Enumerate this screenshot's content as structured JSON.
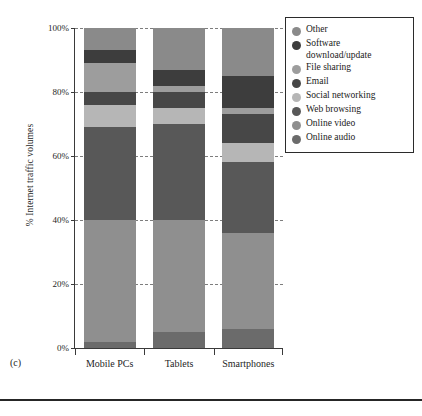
{
  "panel": {
    "label": "(c)"
  },
  "axes": {
    "ylabel": "% Internet traffic volumes",
    "yticks": [
      "0%",
      "20%",
      "40%",
      "60%",
      "80%",
      "100%"
    ],
    "ytick_values": [
      0,
      20,
      40,
      60,
      80,
      100
    ],
    "ylim": [
      0,
      100
    ],
    "xlabel": ""
  },
  "legend": {
    "position": "top-right",
    "entries": [
      {
        "label": "Other",
        "color": "#8a8a8a"
      },
      {
        "label": "Software\ndownload/update",
        "color": "#3d3d3d"
      },
      {
        "label": "File sharing",
        "color": "#9d9d9d"
      },
      {
        "label": "Email",
        "color": "#474747"
      },
      {
        "label": "Social networking",
        "color": "#b6b6b6"
      },
      {
        "label": "Web browsing",
        "color": "#585858"
      },
      {
        "label": "Online video",
        "color": "#8f8f8f"
      },
      {
        "label": "Online audio",
        "color": "#6b6b6b"
      }
    ]
  },
  "chart_data": {
    "type": "bar",
    "subtype": "stacked-bar-100",
    "title": "",
    "xlabel": "",
    "ylabel": "% Internet traffic volumes",
    "ylim": [
      0,
      100
    ],
    "grid": "horizontal-dashed",
    "legend_position": "top-right",
    "categories": [
      "Mobile PCs",
      "Tablets",
      "Smartphones"
    ],
    "series": [
      {
        "name": "Online audio",
        "color": "#6b6b6b",
        "values": [
          2,
          5,
          6
        ]
      },
      {
        "name": "Online video",
        "color": "#8f8f8f",
        "values": [
          38,
          35,
          30
        ]
      },
      {
        "name": "Web browsing",
        "color": "#585858",
        "values": [
          29,
          30,
          22
        ]
      },
      {
        "name": "Social networking",
        "color": "#b6b6b6",
        "values": [
          7,
          5,
          6
        ]
      },
      {
        "name": "Email",
        "color": "#474747",
        "values": [
          4,
          5,
          9
        ]
      },
      {
        "name": "File sharing",
        "color": "#9d9d9d",
        "values": [
          9,
          2,
          2
        ]
      },
      {
        "name": "Software download/update",
        "color": "#3d3d3d",
        "values": [
          4,
          5,
          10
        ]
      },
      {
        "name": "Other",
        "color": "#8a8a8a",
        "values": [
          7,
          13,
          15
        ]
      }
    ]
  }
}
